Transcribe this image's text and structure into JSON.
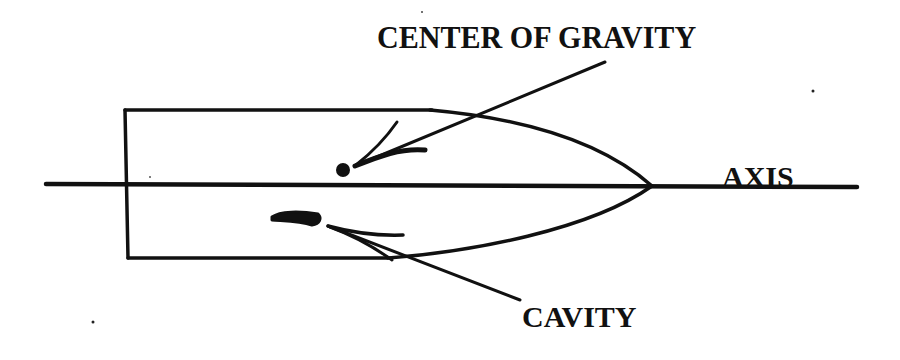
{
  "diagram": {
    "labels": {
      "center_of_gravity": "CENTER OF GRAVITY",
      "axis": "AXIS",
      "cavity": "CAVITY"
    },
    "colors": {
      "ink": "#111111",
      "background": "#ffffff"
    },
    "elements": [
      {
        "name": "body-outline",
        "description": "cylindrical body with parabolic nose cavity, drawn as a rectangle open on the right with curved tip"
      },
      {
        "name": "axis-line",
        "description": "horizontal symmetry axis running through the body"
      },
      {
        "name": "center-of-gravity-dot",
        "description": "solid dot above the axis"
      },
      {
        "name": "cavity-mark",
        "description": "short thick stroke below the axis"
      },
      {
        "name": "arrow-center-of-gravity",
        "description": "leader arrow from label to the dot"
      },
      {
        "name": "arrow-cavity",
        "description": "leader arrow from label to the cavity mark"
      }
    ]
  }
}
